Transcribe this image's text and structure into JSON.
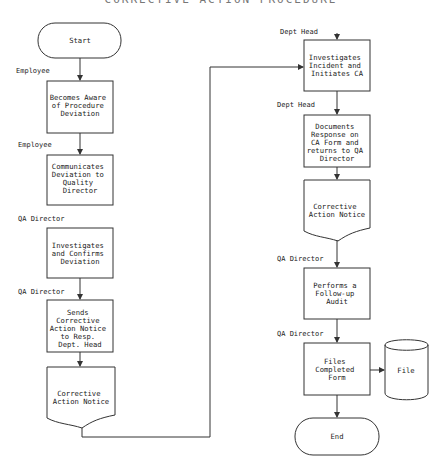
{
  "title": "CORRECTIVE ACTION PROCEDURE",
  "left_column": {
    "start": "Start",
    "steps": [
      {
        "role": "Employee",
        "lines": [
          "Becomes Aware",
          "of Procedure",
          "Deviation"
        ]
      },
      {
        "role": "Employee",
        "lines": [
          "Communicates",
          "Deviation to",
          "Quality",
          "Director"
        ]
      },
      {
        "role": "QA Director",
        "lines": [
          "Investigates",
          "and Confirms",
          "Deviation"
        ]
      },
      {
        "role": "QA Director",
        "lines": [
          "Sends",
          "Corrective",
          "Action Notice",
          "to Resp.",
          "Dept. Head"
        ]
      }
    ],
    "document": [
      "Corrective",
      "Action Notice"
    ]
  },
  "right_column": {
    "steps": [
      {
        "role": "Dept Head",
        "lines": [
          "Investigates",
          "Incident and",
          "Initiates CA"
        ]
      },
      {
        "role": "Dept Head",
        "lines": [
          "Documents",
          "Response on",
          "CA Form and",
          "returns to QA",
          "Director"
        ]
      }
    ],
    "document": [
      "Corrective",
      "Action Notice"
    ],
    "steps2": [
      {
        "role": "QA Director",
        "lines": [
          "Performs a",
          "Follow-up",
          "Audit"
        ]
      },
      {
        "role": "QA Director",
        "lines": [
          "Files",
          "Completed",
          "Form"
        ]
      }
    ],
    "file_store": "File",
    "end": "End"
  }
}
